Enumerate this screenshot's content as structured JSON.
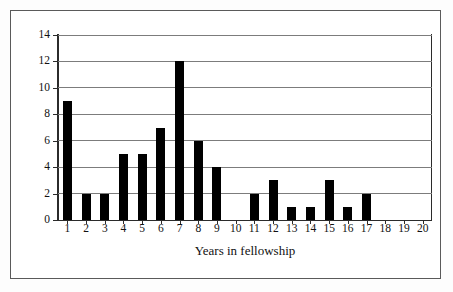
{
  "chart": {
    "type": "bar",
    "title": "",
    "xlabel": "Years in fellowship",
    "ylabel": "Number of fellows leaving"
  },
  "chart_data": {
    "type": "bar",
    "title": "",
    "xlabel": "Years in fellowship",
    "ylabel": "Number of fellows leaving",
    "categories": [
      "1",
      "2",
      "3",
      "4",
      "5",
      "6",
      "7",
      "8",
      "9",
      "10",
      "11",
      "12",
      "13",
      "14",
      "15",
      "16",
      "17",
      "18",
      "19",
      "20"
    ],
    "values": [
      9,
      2,
      2,
      5,
      5,
      7,
      12,
      6,
      4,
      0,
      2,
      3,
      1,
      1,
      3,
      1,
      2,
      0,
      0,
      0
    ],
    "xlim": [
      0.5,
      20.5
    ],
    "ylim": [
      0,
      14
    ],
    "yticks": [
      "0",
      "2",
      "4",
      "6",
      "8",
      "10",
      "12",
      "14"
    ],
    "ytick_values": [
      0,
      2,
      4,
      6,
      8,
      10,
      12,
      14
    ],
    "grid": "horizontal",
    "legend": "none",
    "bar_color": "#000000",
    "gridline_color": "#7c7c7c",
    "axis_color": "#2b2b2b"
  }
}
